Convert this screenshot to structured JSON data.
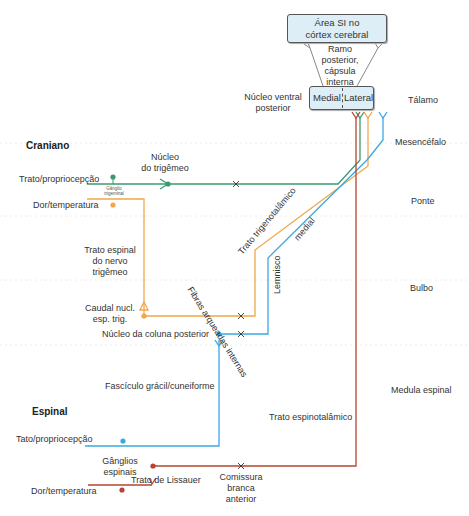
{
  "cortex_box": {
    "line1": "Área SI no",
    "line2": "córtex cerebral"
  },
  "internal_capsule": {
    "line1": "Ramo",
    "line2": "posterior,",
    "line3": "cápsula",
    "line4": "interna"
  },
  "thalamus_box": {
    "medial": "Medial",
    "lateral": "Lateral"
  },
  "vpn_label": {
    "line1": "Núcleo ventral",
    "line2": "posterior"
  },
  "levels": {
    "thalamus": "Tálamo",
    "midbrain": "Mesencéfalo",
    "pons": "Ponte",
    "medulla": "Bulbo",
    "spinal_cord": "Medula espinal"
  },
  "cranial": {
    "heading": "Craniano",
    "touch": "Trato/propriocepção",
    "pain": "Dor/temperatura",
    "ganglion_l1": "Gânglio",
    "ganglion_l2": "trigeminal",
    "trigeminal_nucleus": {
      "line1": "Núcleo",
      "line2": "do trigêmeo"
    },
    "spinal_tract": {
      "line1": "Trato espinal",
      "line2": "do nervo",
      "line3": "trigêmeo"
    },
    "caudal_nucleus": {
      "line1": "Caudal nucl.",
      "line2": "esp. trig."
    },
    "trigeminothalamic": "Trato trigenotalâmico"
  },
  "dorsal_column": {
    "nucleus": "Núcleo da coluna posterior",
    "internal_arcuate": "Fibras arqueadas internas",
    "lemniscus_a": "Lemnisco",
    "lemniscus_b": "medial",
    "fasciculus": "Fascículo grácil/cuneiforme"
  },
  "spinal": {
    "heading": "Espinal",
    "touch": "Tato/propriocepção",
    "pain": "Dor/temperatura",
    "ganglia": {
      "line1": "Gânglios",
      "line2": "espinais"
    },
    "lissauer": "Trato de Lissauer",
    "commissure": {
      "line1": "Comissura",
      "line2": "branca",
      "line3": "anterior"
    },
    "spinothalamic": "Trato espinotalâmico"
  },
  "colors": {
    "green": "#3a9a6e",
    "orange": "#f0a84a",
    "blue": "#3aa8e0",
    "red": "#b5452e",
    "box_fill": "#ddeef6",
    "grid": "#e8e8e8"
  }
}
